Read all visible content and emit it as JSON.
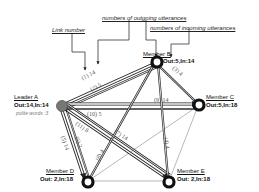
{
  "annotations": {
    "link_number": "Link number",
    "outgoing": "numbers of outgoing utterances",
    "incoming": "numbers of incoming utterances"
  },
  "nodes": {
    "leader_a": {
      "name": "Leader A",
      "stats": "Out:14,In:14",
      "note": "polite words :3",
      "color": "#777777"
    },
    "member_b": {
      "name": "Member B",
      "stats": "Out:5,In:14"
    },
    "member_c": {
      "name": "Member C",
      "stats": "Out:5,In:18"
    },
    "member_d": {
      "name": "Member D",
      "stats": "Out: 2,In:18"
    },
    "member_e": {
      "name": "Member E",
      "stats": "Out: 2,In:18"
    }
  },
  "links": [
    {
      "id": "1",
      "label": "(1) 14",
      "from": "Leader A",
      "to": "Member B"
    },
    {
      "id": "2",
      "label": "(2) 5",
      "from": "Member B",
      "to": "Leader A"
    },
    {
      "id": "3",
      "label": "(3) 4",
      "from": "Member B",
      "to": "Member C"
    },
    {
      "id": "4",
      "label": "(4) 4",
      "from": "Member B",
      "to": "Member E"
    },
    {
      "id": "5",
      "label": "(5) 14",
      "from": "Leader A",
      "to": "Member D"
    },
    {
      "id": "6",
      "label": "(6) 2",
      "from": "Member D",
      "to": "Leader A"
    },
    {
      "id": "7",
      "label": "(7) 14",
      "from": "Leader A",
      "to": "Member E"
    },
    {
      "id": "8",
      "label": "(8) 4",
      "from": "Member B",
      "to": "Member D"
    },
    {
      "id": "9",
      "label": "(9) 14",
      "from": "Leader A",
      "to": "Member C"
    },
    {
      "id": "10",
      "label": "(10) 5",
      "from": "Member C",
      "to": "Leader A"
    },
    {
      "id": "11",
      "label": "(11) 8",
      "from": "Member E",
      "to": "Leader A"
    }
  ]
}
